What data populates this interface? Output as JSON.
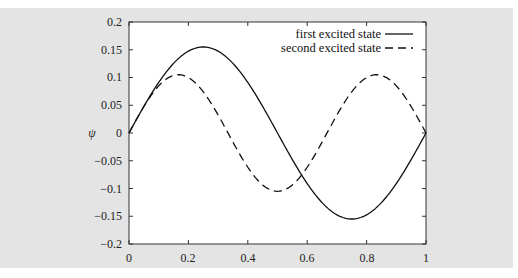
{
  "chart_data": {
    "type": "line",
    "title": "",
    "xlabel": "",
    "ylabel": "ψ",
    "xlim": [
      0,
      1
    ],
    "ylim": [
      -0.2,
      0.2
    ],
    "grid": false,
    "legend_position": "top-right (inside)",
    "x_ticks": [
      "0",
      "0.2",
      "0.4",
      "0.6",
      "0.8",
      "1"
    ],
    "y_ticks": [
      "0.2",
      "0.15",
      "0.1",
      "0.05",
      "0",
      "−0.05",
      "−0.1",
      "−0.15",
      "−0.2"
    ],
    "x": [
      0,
      0.0833,
      0.1667,
      0.25,
      0.3333,
      0.4167,
      0.5,
      0.5833,
      0.6667,
      0.75,
      0.8333,
      0.9167,
      1
    ],
    "series": [
      {
        "name": "first excited state",
        "style": "solid",
        "color": "#111111",
        "values": [
          0,
          0.0775,
          0.1342,
          0.155,
          0.1342,
          0.0775,
          0,
          -0.0775,
          -0.1342,
          -0.155,
          -0.1342,
          -0.0775,
          0
        ]
      },
      {
        "name": "second excited state",
        "style": "dashed",
        "color": "#111111",
        "values": [
          0,
          0.0742,
          0.105,
          0.0742,
          0,
          -0.0742,
          -0.105,
          -0.0742,
          0,
          0.0742,
          0.105,
          0.0742,
          0
        ]
      }
    ]
  },
  "legend": {
    "items": [
      {
        "label": "first excited state"
      },
      {
        "label": "second excited state"
      }
    ]
  },
  "axes": {
    "ylabel": "ψ",
    "x_ticks": [
      "0",
      "0.2",
      "0.4",
      "0.6",
      "0.8",
      "1"
    ],
    "y_ticks": [
      "0.2",
      "0.15",
      "0.1",
      "0.05",
      "0",
      "−0.05",
      "−0.1",
      "−0.15",
      "−0.2"
    ]
  },
  "colors": {
    "panel_background": "#e4e4e4",
    "plot_background": "#ffffff",
    "line": "#111111"
  }
}
